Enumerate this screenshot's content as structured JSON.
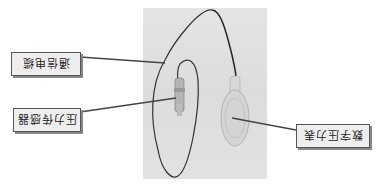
{
  "figure": {
    "orientation": "rotated 180 degrees",
    "labels": {
      "cable": "通信电缆",
      "sensor": "压力传感器",
      "gauge": "数字压力表"
    },
    "colors": {
      "photo_background": "#dedede",
      "label_background": "#eeeeee",
      "label_border": "#555555",
      "cable": "#333333"
    }
  }
}
